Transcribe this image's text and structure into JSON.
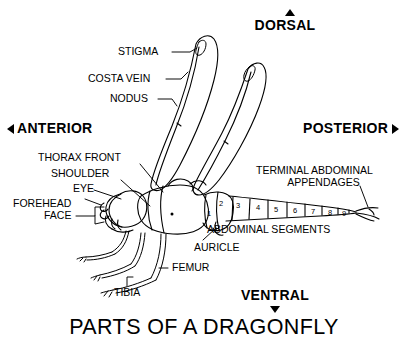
{
  "diagram": {
    "title": "PARTS OF A DRAGONFLY",
    "background_color": "#ffffff",
    "line_color": "#000000"
  },
  "orientation_labels": {
    "dorsal": "DORSAL",
    "ventral": "VENTRAL",
    "anterior": "ANTERIOR",
    "posterior": "POSTERIOR",
    "dorsal_marker": "triangle-up",
    "ventral_marker": "triangle-down",
    "anterior_marker": "triangle-left",
    "posterior_marker": "triangle-right"
  },
  "callouts": [
    {
      "id": "stigma",
      "label": "STIGMA"
    },
    {
      "id": "costa-vein",
      "label": "COSTA VEIN"
    },
    {
      "id": "nodus",
      "label": "NODUS"
    },
    {
      "id": "thorax-front",
      "label": "THORAX FRONT"
    },
    {
      "id": "shoulder",
      "label": "SHOULDER"
    },
    {
      "id": "eye",
      "label": "EYE"
    },
    {
      "id": "forehead",
      "label": "FOREHEAD"
    },
    {
      "id": "face",
      "label": "FACE"
    },
    {
      "id": "femur",
      "label": "FEMUR"
    },
    {
      "id": "tibia",
      "label": "TIBIA"
    },
    {
      "id": "auricle",
      "label": "AURICLE"
    },
    {
      "id": "abdominal-segments",
      "label": "ABDOMINAL SEGMENTS"
    },
    {
      "id": "terminal-appendages-line1",
      "label": "TERMINAL ABDOMINAL"
    },
    {
      "id": "terminal-appendages-line2",
      "label": "APPENDAGES"
    }
  ],
  "abdominal_segment_numbers": [
    "1",
    "2",
    "3",
    "4",
    "5",
    "6",
    "7",
    "8",
    "9"
  ]
}
